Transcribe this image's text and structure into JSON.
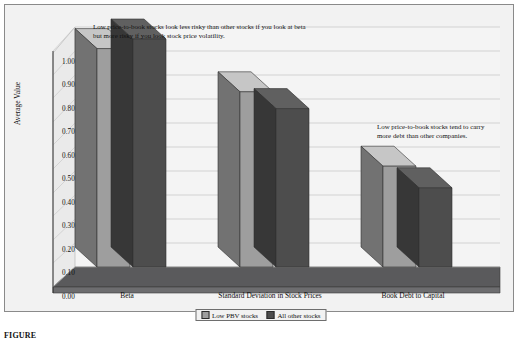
{
  "chart_data": {
    "type": "bar",
    "title": "",
    "xlabel": "",
    "ylabel": "Average Value",
    "ylim": [
      0,
      1.0
    ],
    "ytick_step": 0.1,
    "grid": true,
    "legend_position": "bottom",
    "style": "3d-clustered-column",
    "categories": [
      "Beta",
      "Standard Deviation in Stock Prices",
      "Book Debt to Capital"
    ],
    "yticks": [
      "0.00",
      "0.10",
      "0.20",
      "0.30",
      "0.40",
      "0.50",
      "0.60",
      "0.70",
      "0.80",
      "0.90",
      "1.00"
    ],
    "series": [
      {
        "name": "Low PBV stocks",
        "color": "#9e9e9e",
        "values": [
          0.91,
          0.73,
          0.42
        ]
      },
      {
        "name": "All other stocks",
        "color": "#4d4d4d",
        "values": [
          0.95,
          0.66,
          0.33
        ]
      }
    ],
    "annotations": [
      {
        "name": "risk-note",
        "text": "Low price-to-book stocks look less risky than other stocks if you look at beta but more risky if you look stock price volatility."
      },
      {
        "name": "debt-note",
        "text": "Low price-to-book stocks tend to carry more debt than other companies."
      }
    ]
  },
  "caption": {
    "text": "FIGURE"
  },
  "colors": {
    "series_low_pbv": "#9e9e9e",
    "series_all_other": "#4d4d4d",
    "plot_background": "#f2f2f2",
    "floor": "#58585a",
    "gridline": "#b9b9b9",
    "axis": "#3a3a3a"
  }
}
